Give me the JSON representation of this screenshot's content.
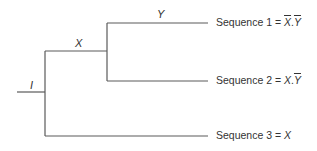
{
  "diagram": {
    "type": "tree",
    "branch_labels": {
      "root": "I",
      "upper": "X",
      "upper_upper": "Y"
    },
    "leaves": [
      {
        "prefix": "Sequence 1 = ",
        "terms": [
          {
            "name": "X",
            "negated": true
          },
          {
            "sep": "."
          },
          {
            "name": "Y",
            "negated": true
          }
        ]
      },
      {
        "prefix": "Sequence 2 = ",
        "terms": [
          {
            "name": "X",
            "negated": false
          },
          {
            "sep": "."
          },
          {
            "name": "Y",
            "negated": true
          }
        ]
      },
      {
        "prefix": "Sequence 3 = ",
        "terms": [
          {
            "name": "X",
            "negated": false
          }
        ]
      }
    ]
  },
  "text": {
    "label_I": "I",
    "label_X": "X",
    "label_Y": "Y",
    "seq1_prefix": "Sequence 1 = ",
    "seq1_a": "X",
    "seq1_dot": ".",
    "seq1_b": "Y",
    "seq2_prefix": "Sequence 2 = ",
    "seq2_a": "X",
    "seq2_dot": ".",
    "seq2_b": "Y",
    "seq3_prefix": "Sequence 3 = ",
    "seq3_a": "X"
  }
}
